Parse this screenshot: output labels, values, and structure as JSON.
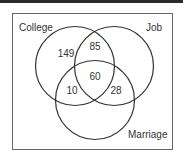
{
  "diagram": {
    "type": "venn",
    "sets": [
      {
        "id": "college",
        "label": "College"
      },
      {
        "id": "job",
        "label": "Job"
      },
      {
        "id": "marriage",
        "label": "Marriage"
      }
    ],
    "regions": {
      "college_only": "149",
      "college_job": "85",
      "all_three": "60",
      "college_marriage": "10",
      "job_marriage": "28"
    },
    "colors": {
      "stroke": "#333333",
      "frame": "#666666",
      "topbar": "#2a2a2a"
    }
  }
}
